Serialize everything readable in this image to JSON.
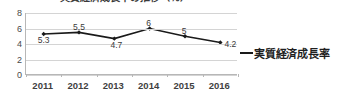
{
  "chart_data": {
    "type": "line",
    "title": "実質経済成長率の推移（％）",
    "title_note": "title is cropped off the top edge of the screenshot",
    "xlabel": "",
    "ylabel": "",
    "categories": [
      "2011",
      "2012",
      "2013",
      "2014",
      "2015",
      "2016"
    ],
    "values": [
      5.3,
      5.5,
      4.7,
      6,
      5,
      4.2
    ],
    "data_labels": [
      "5.3",
      "5.5",
      "4.7",
      "6",
      "5",
      "4.2"
    ],
    "series": [
      {
        "name": "実質経済成長率",
        "values": [
          5.3,
          5.5,
          4.7,
          6,
          5,
          4.2
        ],
        "color": "#1a1a1a"
      }
    ],
    "ylim": [
      0,
      8
    ],
    "yticks": [
      0,
      2,
      4,
      6,
      8
    ],
    "ytick_labels": [
      "0",
      "2",
      "4",
      "6",
      "8"
    ],
    "grid": true,
    "grid_axis": "y",
    "legend": {
      "position": "right",
      "entries": [
        {
          "label": "実質経済成長率",
          "color": "#1a1a1a",
          "marker": "line"
        }
      ]
    },
    "marker": "diamond",
    "line_color": "#1a1a1a",
    "plot_background": "#ffffff"
  },
  "colors": {
    "series": "#1a1a1a",
    "gridline": "#d4d4d4",
    "axis": "#b7b7b7",
    "tick_text": "#4a4a4a",
    "label_text": "#3f3f3f",
    "background": "#ffffff"
  }
}
